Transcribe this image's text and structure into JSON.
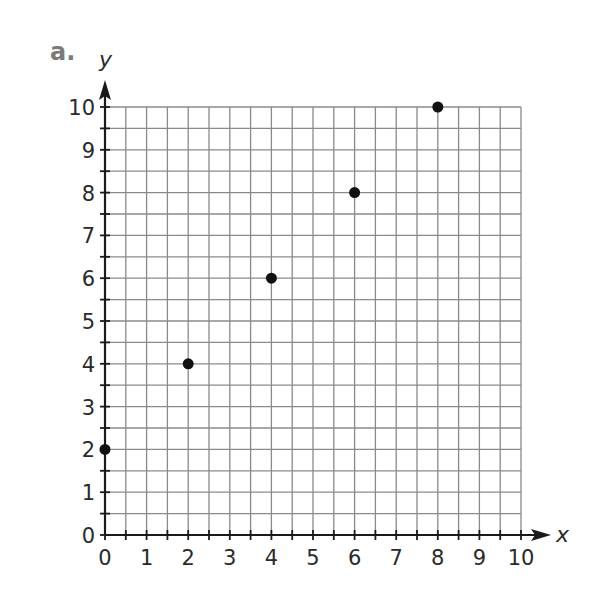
{
  "problem_label": "a.",
  "chart_data": {
    "type": "scatter",
    "title": "",
    "xlabel": "x",
    "ylabel": "y",
    "xlim": [
      0,
      10
    ],
    "ylim": [
      0,
      10
    ],
    "x_ticks": [
      0,
      1,
      2,
      3,
      4,
      5,
      6,
      7,
      8,
      9,
      10
    ],
    "y_ticks": [
      0,
      1,
      2,
      3,
      4,
      5,
      6,
      7,
      8,
      9,
      10
    ],
    "grid": true,
    "grid_step": 0.5,
    "legend": null,
    "series": [
      {
        "name": "points",
        "color": "#111111",
        "points": [
          {
            "x": 0,
            "y": 2
          },
          {
            "x": 2,
            "y": 4
          },
          {
            "x": 4,
            "y": 6
          },
          {
            "x": 6,
            "y": 8
          },
          {
            "x": 8,
            "y": 10
          }
        ]
      }
    ]
  },
  "colors": {
    "grid": "#8a8a8a",
    "axis": "#1a1a1a",
    "text": "#2a2a2a",
    "problem_label": "#7a7a7a"
  }
}
